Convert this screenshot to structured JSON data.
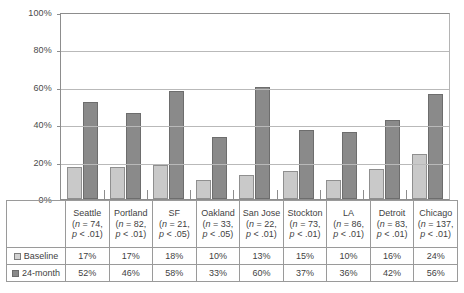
{
  "chart_data": {
    "type": "bar",
    "title": "",
    "xlabel": "",
    "ylabel": "",
    "ylim": [
      0,
      100
    ],
    "grid": true,
    "legend_position": "bottom-table",
    "categories": [
      "Seattle",
      "Portland",
      "SF",
      "Oakland",
      "San Jose",
      "Stockton",
      "LA",
      "Detroit",
      "Chicago"
    ],
    "tick_labels": [
      "0%",
      "20%",
      "40%",
      "60%",
      "80%",
      "100%"
    ],
    "tick_values": [
      0,
      20,
      40,
      60,
      80,
      100
    ],
    "series": [
      {
        "name": "Baseline",
        "color": "#c9c9c9",
        "values": [
          17,
          17,
          18,
          10,
          13,
          15,
          10,
          16,
          24
        ]
      },
      {
        "name": "24-month",
        "color": "#8a8a8a",
        "values": [
          52,
          46,
          58,
          33,
          60,
          37,
          36,
          42,
          56
        ]
      }
    ],
    "value_labels": {
      "Baseline": [
        "17%",
        "17%",
        "18%",
        "10%",
        "13%",
        "15%",
        "10%",
        "16%",
        "24%"
      ],
      "24-month": [
        "52%",
        "46%",
        "58%",
        "33%",
        "60%",
        "37%",
        "36%",
        "42%",
        "56%"
      ]
    },
    "annotations": [
      {
        "category": "Seattle",
        "n": "(n = 74,",
        "p": "p < .01)"
      },
      {
        "category": "Portland",
        "n": "(n = 82,",
        "p": "p < .01)"
      },
      {
        "category": "SF",
        "n": "(n = 21,",
        "p": "p < .05)"
      },
      {
        "category": "Oakland",
        "n": "(n = 33,",
        "p": "p < .05)"
      },
      {
        "category": "San Jose",
        "n": "(n = 22,",
        "p": "p < .01)"
      },
      {
        "category": "Stockton",
        "n": "(n = 73,",
        "p": "p < .01)"
      },
      {
        "category": "LA",
        "n": "(n = 86,",
        "p": "p < .01)"
      },
      {
        "category": "Detroit",
        "n": "(n = 83,",
        "p": "p < .01)"
      },
      {
        "category": "Chicago",
        "n": "(n = 137,",
        "p": "p < .01)"
      }
    ]
  },
  "legend": {
    "row_labels": [
      "Baseline",
      "24-month"
    ],
    "swatch_names": [
      "baseline-swatch",
      "followup-swatch"
    ]
  }
}
